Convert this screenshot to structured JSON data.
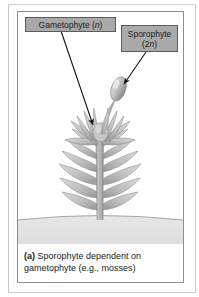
{
  "figure": {
    "panel_label": "(a)",
    "caption_text": "Sporophyte dependent on gametophyte (e.g., mosses)",
    "caption_line1": "Sporophyte dependent on",
    "caption_line2": "gametophyte (e.g., mosses)"
  },
  "callouts": {
    "gametophyte": {
      "text": "Gametophyte (n)",
      "label_prefix": "Gametophyte (",
      "label_italic": "n",
      "label_suffix": ")"
    },
    "sporophyte": {
      "text": "Sporophyte (2n)",
      "line1": "Sporophyte",
      "line2_prefix": "(2",
      "line2_italic": "n",
      "line2_suffix": ")"
    }
  },
  "colors": {
    "callout_fill": "#a9a9a9",
    "callout_border": "#5c5c5c",
    "panel_border": "#8f8f93",
    "plant_light": "#d2d2d2",
    "plant_mid": "#b0b0b0",
    "plant_dark": "#8e8e8e",
    "ground_fill": "#e2e2e2",
    "ground_line": "#9b9b9b",
    "arrow": "#1a1a1a",
    "text": "#1b1b1b",
    "background": "#ffffff"
  },
  "diagram": {
    "organism": "moss",
    "ground_label": "soil-surface",
    "parts": [
      "sporophyte-capsule",
      "sporophyte-seta",
      "gametophyte-rosette",
      "gametophyte-leaves",
      "gametophyte-stem"
    ]
  }
}
